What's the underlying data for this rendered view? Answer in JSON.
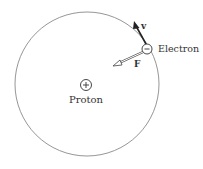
{
  "diagram": {
    "orbit": {
      "cx": 87,
      "cy": 84,
      "r": 72,
      "color": "#888888"
    },
    "proton": {
      "label": "Proton",
      "symbol": "+",
      "x": 86,
      "y": 85
    },
    "electron": {
      "label": "Electron",
      "symbol": "−",
      "x": 147,
      "y": 49
    },
    "velocity": {
      "label": "v"
    },
    "force": {
      "label": "F"
    }
  }
}
